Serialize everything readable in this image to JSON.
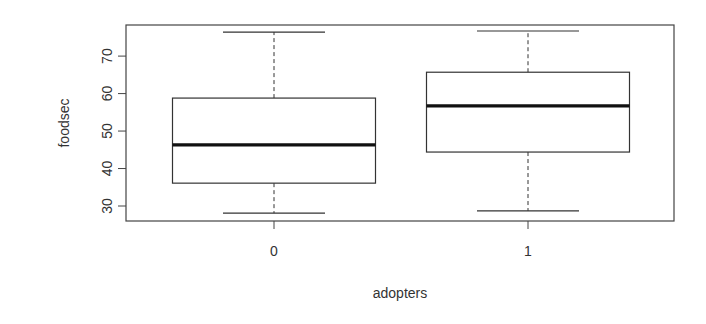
{
  "chart_data": {
    "type": "boxplot",
    "title": "",
    "xlabel": "adopters",
    "ylabel": "foodsec",
    "categories": [
      "0",
      "1"
    ],
    "series": [
      {
        "name": "0",
        "whisker_low": 28.1,
        "q1": 36.1,
        "median": 46.3,
        "q3": 58.8,
        "whisker_high": 76.4
      },
      {
        "name": "1",
        "whisker_low": 28.7,
        "q1": 44.4,
        "median": 56.7,
        "q3": 65.7,
        "whisker_high": 76.7
      }
    ],
    "yticks": [
      30,
      40,
      50,
      60,
      70
    ],
    "ylim": [
      26,
      78.3
    ],
    "grid": false,
    "legend": null
  }
}
